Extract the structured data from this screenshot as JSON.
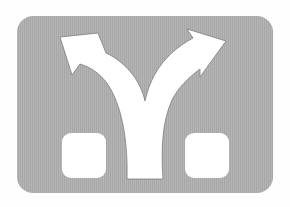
{
  "image": {
    "description": "Road sign pictogram: fork in road with two diverging arrows",
    "label": "Fork left and right"
  },
  "sign": {
    "shape": "rounded-rectangle",
    "symbol": "Y-fork-arrows",
    "holes": 2
  },
  "colors": {
    "background": "#fefefe",
    "panel": "#a9a9a9",
    "stripe": "#b6b6b6",
    "symbol": "#ffffff",
    "outline": "#7a7a7a"
  }
}
